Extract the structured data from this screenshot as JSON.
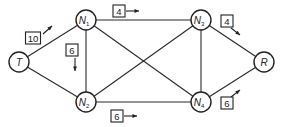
{
  "diagram": {
    "type": "flow-network",
    "nodes": [
      {
        "id": "T",
        "label": "T",
        "sub": ""
      },
      {
        "id": "N1",
        "label": "N",
        "sub": "1"
      },
      {
        "id": "N2",
        "label": "N",
        "sub": "2"
      },
      {
        "id": "N3",
        "label": "N",
        "sub": "3"
      },
      {
        "id": "N4",
        "label": "N",
        "sub": "4"
      },
      {
        "id": "R",
        "label": "R",
        "sub": ""
      }
    ],
    "edges": [
      {
        "from": "T",
        "to": "N1"
      },
      {
        "from": "T",
        "to": "N2"
      },
      {
        "from": "N1",
        "to": "N2"
      },
      {
        "from": "N1",
        "to": "N3"
      },
      {
        "from": "N1",
        "to": "N4"
      },
      {
        "from": "N2",
        "to": "N3"
      },
      {
        "from": "N2",
        "to": "N4"
      },
      {
        "from": "N3",
        "to": "N4"
      },
      {
        "from": "N3",
        "to": "R"
      },
      {
        "from": "N4",
        "to": "R"
      }
    ],
    "flow_labels": [
      {
        "edge": "T-N1",
        "value": "10",
        "direction": "toward N1"
      },
      {
        "edge": "N1-N3",
        "value": "4",
        "direction": "toward N3"
      },
      {
        "edge": "N1-N2",
        "value": "6",
        "direction": "toward N2"
      },
      {
        "edge": "N3-R",
        "value": "4",
        "direction": "toward R"
      },
      {
        "edge": "N4-R",
        "value": "6",
        "direction": "toward R"
      },
      {
        "edge": "N2-N4",
        "value": "6",
        "direction": "toward N4"
      }
    ]
  }
}
